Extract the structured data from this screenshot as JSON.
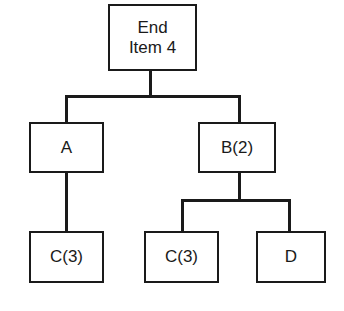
{
  "diagram": {
    "type": "product-structure-tree",
    "nodes": [
      {
        "id": "end-item",
        "label": "End\nItem 4",
        "level": 0
      },
      {
        "id": "a",
        "label": "A",
        "level": 1,
        "parent": "end-item"
      },
      {
        "id": "b",
        "label": "B(2)",
        "level": 1,
        "parent": "end-item"
      },
      {
        "id": "c-under-a",
        "label": "C(3)",
        "level": 2,
        "parent": "a"
      },
      {
        "id": "c-under-b",
        "label": "C(3)",
        "level": 2,
        "parent": "b"
      },
      {
        "id": "d",
        "label": "D",
        "level": 2,
        "parent": "b"
      }
    ],
    "edges": [
      {
        "from": "end-item",
        "to": "a"
      },
      {
        "from": "end-item",
        "to": "b"
      },
      {
        "from": "a",
        "to": "c-under-a"
      },
      {
        "from": "b",
        "to": "c-under-b"
      },
      {
        "from": "b",
        "to": "d"
      }
    ],
    "colors": {
      "stroke": "#1a1a1a",
      "background": "#ffffff"
    }
  }
}
